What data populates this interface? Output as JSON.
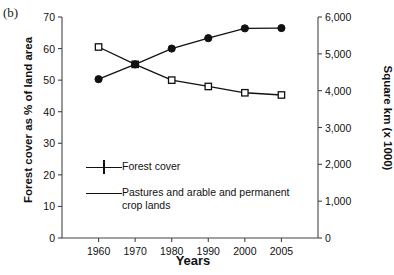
{
  "panel_label": "(b)",
  "chart_data": {
    "type": "line",
    "title": "",
    "subtitle": "",
    "xlabel": "Years",
    "ylabel": "Forest cover as % of land area",
    "y2label": "Square km (x 1000)",
    "categories": [
      "1960",
      "1970",
      "1980",
      "1990",
      "2000",
      "2005"
    ],
    "ylim": [
      0,
      70
    ],
    "yticks": [
      0,
      10,
      20,
      30,
      40,
      50,
      60,
      70
    ],
    "ytick_labels": [
      "0",
      "10",
      "20",
      "30",
      "40",
      "50",
      "60",
      "70"
    ],
    "y2lim": [
      0,
      6000
    ],
    "y2ticks": [
      0,
      1000,
      2000,
      3000,
      4000,
      5000,
      6000
    ],
    "y2tick_labels": [
      "0",
      "1,000",
      "2,000",
      "3,000",
      "4,000",
      "5,000",
      "6,000"
    ],
    "grid": false,
    "legend_position": "inside-lower-left",
    "series": [
      {
        "name": "Forest cover",
        "marker": "open-square",
        "color": "#111111",
        "values": [
          60.5,
          55.0,
          50.0,
          48.0,
          46.0,
          45.3
        ]
      },
      {
        "name": "Pastures and arable and permanent\ncrop lands",
        "marker": "filled-circle",
        "color": "#111111",
        "values": [
          50.3,
          55.0,
          60.0,
          63.3,
          66.4,
          66.5
        ]
      }
    ]
  },
  "legend": {
    "items": [
      {
        "label": "Forest cover",
        "marker": "open-square"
      },
      {
        "label": "Pastures and arable and permanent\ncrop lands",
        "marker": "filled-circle"
      }
    ]
  }
}
